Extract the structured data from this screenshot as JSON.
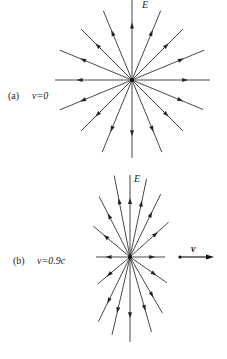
{
  "figure": {
    "panel_a": {
      "tag": "(a)",
      "condition": "v=0",
      "field_label": "E",
      "center": [
        132,
        80
      ],
      "line_color": "#333333",
      "lines": [
        {
          "angle": 90,
          "len": 80
        },
        {
          "angle": 67.5,
          "len": 75
        },
        {
          "angle": 45,
          "len": 72
        },
        {
          "angle": 22.5,
          "len": 78
        },
        {
          "angle": 0,
          "len": 78
        },
        {
          "angle": -22.5,
          "len": 77
        },
        {
          "angle": -45,
          "len": 72
        },
        {
          "angle": -67.5,
          "len": 78
        },
        {
          "angle": -90,
          "len": 78
        },
        {
          "angle": -112.5,
          "len": 78
        },
        {
          "angle": -135,
          "len": 72
        },
        {
          "angle": -157.5,
          "len": 78
        },
        {
          "angle": 180,
          "len": 77
        },
        {
          "angle": 157.5,
          "len": 78
        },
        {
          "angle": 135,
          "len": 72
        },
        {
          "angle": 112.5,
          "len": 75
        }
      ]
    },
    "panel_b": {
      "tag": "(b)",
      "condition": "v=0.9c",
      "field_label": "E",
      "velocity_label": "v",
      "center": [
        130,
        257
      ],
      "line_color": "#333333",
      "lines": [
        {
          "angle": 90,
          "len": 82
        },
        {
          "angle": 78,
          "len": 80
        },
        {
          "angle": 64,
          "len": 70
        },
        {
          "angle": 42,
          "len": 52
        },
        {
          "angle": 0,
          "len": 35
        },
        {
          "angle": -35,
          "len": 45
        },
        {
          "angle": -60,
          "len": 65
        },
        {
          "angle": -74,
          "len": 78
        },
        {
          "angle": -90,
          "len": 85
        },
        {
          "angle": -103,
          "len": 80
        },
        {
          "angle": -116,
          "len": 72
        },
        {
          "angle": -140,
          "len": 42
        },
        {
          "angle": 180,
          "len": 34
        },
        {
          "angle": 140,
          "len": 48
        },
        {
          "angle": 117,
          "len": 68
        },
        {
          "angle": 101,
          "len": 83
        }
      ],
      "velocity_arrow": {
        "x1": 180,
        "y1": 257,
        "x2": 214,
        "y2": 257
      }
    }
  }
}
